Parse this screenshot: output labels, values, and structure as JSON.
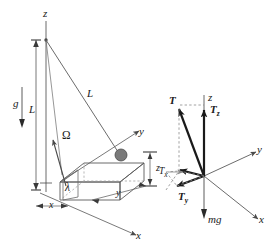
{
  "figure": {
    "stroke_color": "#4a4a4a",
    "bold_stroke_color": "#1a1a1a",
    "dashed_color": "#8a8a8a",
    "bob_color": "#6e6e6e",
    "background": "#ffffff"
  },
  "left_diagram": {
    "name": "pendulum-block-diagram",
    "labels": {
      "z_axis": "z",
      "y_axis": "y",
      "x_axis": "x",
      "gravity": "g",
      "length_vertical": "L",
      "length_diagonal": "L",
      "omega": "Ω",
      "lambda": "λ",
      "dim_x": "x",
      "dim_y": "y",
      "dim_z": "z"
    }
  },
  "right_diagram": {
    "name": "force-vector-diagram",
    "labels": {
      "z_axis": "z",
      "y_axis": "y",
      "x_axis": "x",
      "tension": "T",
      "tension_z": "T",
      "tension_z_sub": "z",
      "tension_y": "T",
      "tension_y_sub": "y",
      "tension_x": "T",
      "tension_x_sub": "x",
      "weight": "mg"
    }
  }
}
